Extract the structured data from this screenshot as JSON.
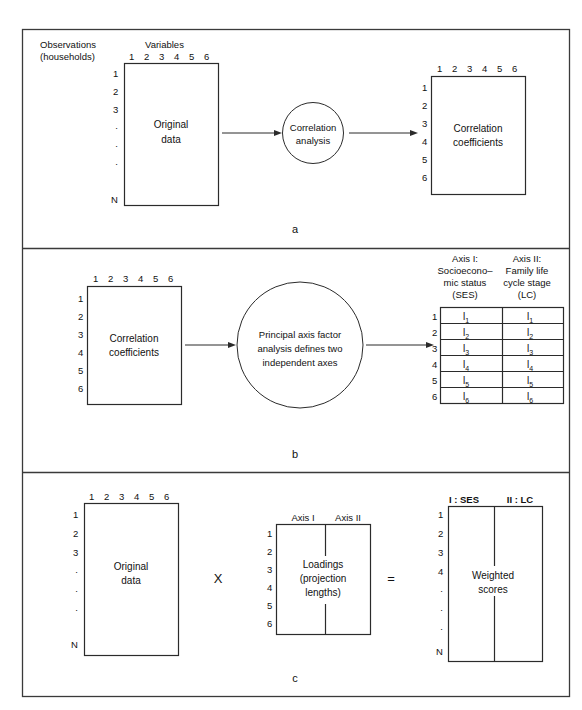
{
  "figure": {
    "type": "flow-diagram",
    "panels": [
      {
        "letter": "a",
        "nodes": {
          "left_box": {
            "line1": "Original",
            "line2": "data",
            "top_label": "Variables",
            "left_label_line1": "Observations",
            "left_label_line2": "(households)",
            "col_headers": [
              "1",
              "2",
              "3",
              "4",
              "5",
              "6"
            ],
            "row_headers": [
              "1",
              "2",
              "3",
              "·",
              "·",
              "·",
              "N"
            ]
          },
          "circle": {
            "line1": "Correlation",
            "line2": "analysis"
          },
          "right_box": {
            "line1": "Correlation",
            "line2": "coefficients",
            "col_headers": [
              "1",
              "2",
              "3",
              "4",
              "5",
              "6"
            ],
            "row_headers": [
              "1",
              "2",
              "3",
              "4",
              "5",
              "6"
            ]
          }
        }
      },
      {
        "letter": "b",
        "nodes": {
          "left_box": {
            "line1": "Correlation",
            "line2": "coefficients",
            "col_headers": [
              "1",
              "2",
              "3",
              "4",
              "5",
              "6"
            ],
            "row_headers": [
              "1",
              "2",
              "3",
              "4",
              "5",
              "6"
            ]
          },
          "circle": {
            "line1": "Principal axis factor",
            "line2": "analysis defines two",
            "line3": "independent axes"
          },
          "table": {
            "col1_header": [
              "Axis I:",
              "Socioecono–",
              "mic status",
              "(SES)"
            ],
            "col2_header": [
              "Axis II:",
              "Family life",
              "cycle stage",
              "(LC)"
            ],
            "row_headers": [
              "1",
              "2",
              "3",
              "4",
              "5",
              "6"
            ],
            "cell_base": "l",
            "cell_subs": [
              "1",
              "2",
              "3",
              "4",
              "5",
              "6"
            ]
          }
        }
      },
      {
        "letter": "c",
        "nodes": {
          "left_box": {
            "line1": "Original",
            "line2": "data",
            "col_headers": [
              "1",
              "2",
              "3",
              "4",
              "5",
              "6"
            ],
            "row_headers": [
              "1",
              "2",
              "3",
              "·",
              "·",
              "·",
              "N"
            ]
          },
          "operator_multiply": "X",
          "middle_box": {
            "line1": "Loadings",
            "line2": "(projection",
            "line3": "lengths)",
            "col1_header": "Axis I",
            "col2_header": "Axis II",
            "row_headers": [
              "1",
              "2",
              "3",
              "4",
              "5",
              "6"
            ]
          },
          "operator_equals": "=",
          "right_box": {
            "line1": "Weighted",
            "line2": "scores",
            "col1_header": "I : SES",
            "col2_header": "II : LC",
            "row_headers": [
              "1",
              "2",
              "3",
              "4",
              "·",
              "·",
              "·",
              "N"
            ]
          }
        }
      }
    ],
    "colors": {
      "ink": "#111111",
      "line": "#2b2b2b",
      "frame": "#3a3a3a",
      "background": "#ffffff"
    }
  }
}
